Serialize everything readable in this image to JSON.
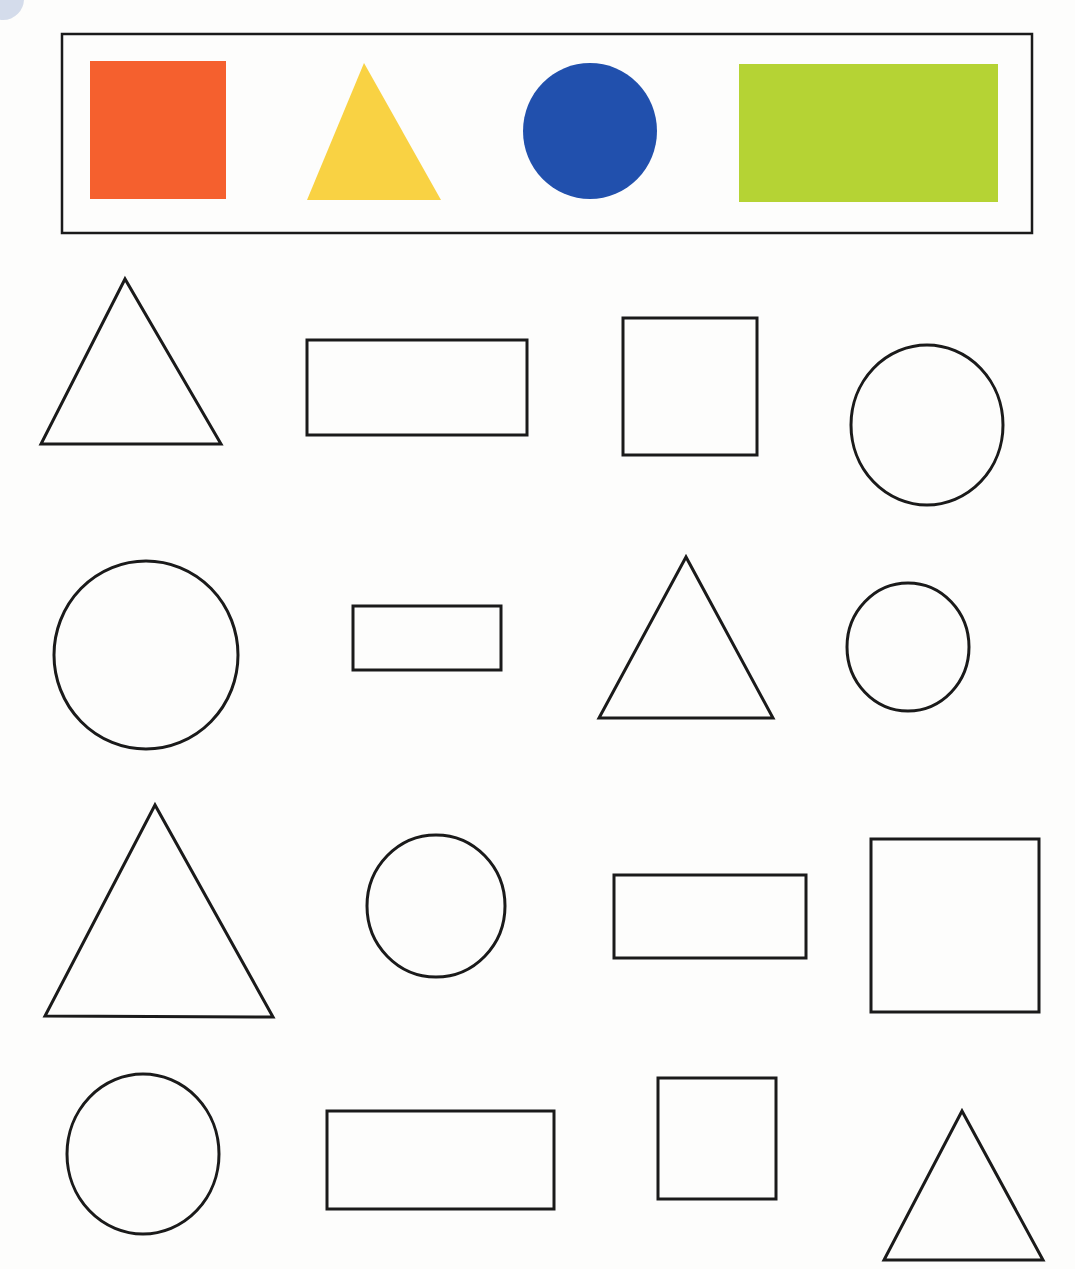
{
  "page": {
    "width": 1075,
    "height": 1269,
    "background": "#fdfdfc",
    "outline_color": "#1a1a1a",
    "outline_width": 3
  },
  "legend": {
    "box": {
      "x": 62,
      "y": 34,
      "w": 970,
      "h": 199,
      "stroke": "#1a1a1a",
      "stroke_width": 2.5
    },
    "keys": [
      {
        "shape": "square",
        "color": "#f5602e",
        "x": 90,
        "y": 61,
        "w": 136,
        "h": 138
      },
      {
        "shape": "triangle",
        "color": "#f9d243",
        "points": [
          [
            364,
            63
          ],
          [
            307,
            200
          ],
          [
            441,
            200
          ]
        ]
      },
      {
        "shape": "circle",
        "color": "#2150ad",
        "cx": 590,
        "cy": 131,
        "rx": 67,
        "ry": 68
      },
      {
        "shape": "rectangle",
        "color": "#b5d334",
        "x": 739,
        "y": 64,
        "w": 259,
        "h": 138
      }
    ]
  },
  "grid": {
    "rows": [
      [
        {
          "shape": "triangle",
          "points": [
            [
              125,
              279
            ],
            [
              41,
              444
            ],
            [
              221,
              444
            ]
          ]
        },
        {
          "shape": "rectangle",
          "x": 307,
          "y": 340,
          "w": 220,
          "h": 95
        },
        {
          "shape": "square",
          "x": 623,
          "y": 318,
          "w": 134,
          "h": 137
        },
        {
          "shape": "circle",
          "cx": 927,
          "cy": 425,
          "rx": 76,
          "ry": 80
        }
      ],
      [
        {
          "shape": "circle",
          "cx": 146,
          "cy": 655,
          "rx": 92,
          "ry": 94
        },
        {
          "shape": "rectangle",
          "x": 353,
          "y": 606,
          "w": 148,
          "h": 64
        },
        {
          "shape": "triangle",
          "points": [
            [
              686,
              557
            ],
            [
              599,
              718
            ],
            [
              773,
              718
            ]
          ]
        },
        {
          "shape": "circle",
          "cx": 908,
          "cy": 647,
          "rx": 61,
          "ry": 64
        }
      ],
      [
        {
          "shape": "triangle",
          "points": [
            [
              155,
              805
            ],
            [
              45,
              1016
            ],
            [
              273,
              1017
            ]
          ]
        },
        {
          "shape": "circle",
          "cx": 436,
          "cy": 906,
          "rx": 69,
          "ry": 71
        },
        {
          "shape": "rectangle",
          "x": 614,
          "y": 875,
          "w": 192,
          "h": 83
        },
        {
          "shape": "square",
          "x": 871,
          "y": 839,
          "w": 168,
          "h": 173
        }
      ],
      [
        {
          "shape": "circle",
          "cx": 143,
          "cy": 1154,
          "rx": 76,
          "ry": 80
        },
        {
          "shape": "rectangle",
          "x": 327,
          "y": 1111,
          "w": 227,
          "h": 98
        },
        {
          "shape": "square",
          "x": 658,
          "y": 1078,
          "w": 118,
          "h": 121
        },
        {
          "shape": "triangle",
          "points": [
            [
              962,
              1111
            ],
            [
              884,
              1260
            ],
            [
              1043,
              1260
            ]
          ]
        }
      ]
    ]
  }
}
